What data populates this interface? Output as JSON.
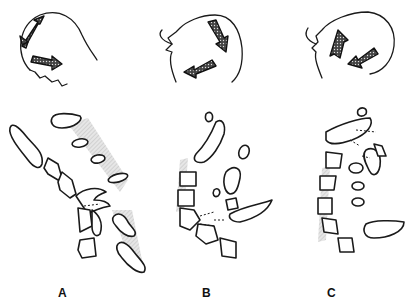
{
  "figure": {
    "type": "medical line illustration",
    "panels": [
      {
        "label": "A",
        "head_motion": "flexion arrows",
        "spine": "flexed cervical spine with shaded ligament zone"
      },
      {
        "label": "B",
        "head_motion": "extension arrows",
        "spine": "curved cervical spine, disrupted segment"
      },
      {
        "label": "C",
        "head_motion": "rotational arrows",
        "spine": "curved cervical spine with dashed fracture lines"
      }
    ]
  },
  "colors": {
    "line": "#1a1a1a",
    "shade": "#c8c8c8",
    "background": "#ffffff"
  }
}
